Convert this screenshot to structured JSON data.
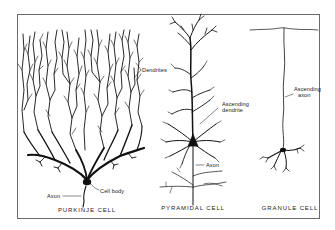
{
  "figure": {
    "type": "neuron-types-illustration",
    "colors": {
      "ink": "#111111",
      "frame": "#6b6b6b",
      "background": "#ffffff"
    },
    "panels": [
      {
        "id": "purkinje",
        "caption": "PURKINJE CELL",
        "labels": {
          "dendrites": "Dendrites",
          "cell_body": "Cell body",
          "axon": "Axon"
        }
      },
      {
        "id": "pyramidal",
        "caption": "PYRAMIDAL CELL",
        "labels": {
          "ascending_dendrite_1": "Ascending",
          "ascending_dendrite_2": "dendrite",
          "axon": "Axon"
        }
      },
      {
        "id": "granule",
        "caption": "GRANULE CELL",
        "labels": {
          "ascending_axon_1": "Ascending",
          "ascending_axon_2": "axon"
        }
      }
    ]
  }
}
